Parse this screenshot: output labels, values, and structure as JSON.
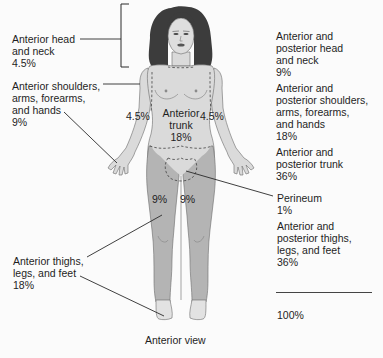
{
  "colors": {
    "background": "#fbfbfb",
    "skin": "#dadada",
    "legs": "#b4b4b4",
    "hair": "#3c3c3c",
    "outline": "#6a6a6a",
    "leader_line": "#2a2a2a",
    "text": "#1e1e1e"
  },
  "caption": "Anterior view",
  "left_labels": [
    {
      "id": "anterior-head-neck",
      "lines": [
        "Anterior head",
        "and neck",
        "4.5%"
      ]
    },
    {
      "id": "anterior-arms",
      "lines": [
        "Anterior shoulders,",
        "arms, forearms,",
        "and hands",
        "9%"
      ]
    },
    {
      "id": "anterior-legs",
      "lines": [
        "Anterior thighs,",
        "legs, and feet",
        "18%"
      ]
    }
  ],
  "body_labels": {
    "left_arm_pct": "4.5%",
    "right_arm_pct": "4.5%",
    "trunk_line1": "Anterior",
    "trunk_line2": "trunk",
    "trunk_pct": "18%",
    "left_thigh_pct": "9%",
    "right_thigh_pct": "9%"
  },
  "right_labels": [
    {
      "id": "ap-head-neck",
      "lines": [
        "Anterior and",
        "posterior head",
        "and neck",
        "9%"
      ]
    },
    {
      "id": "ap-arms",
      "lines": [
        "Anterior and",
        "posterior shoulders,",
        "arms, forearms,",
        "and hands",
        "18%"
      ]
    },
    {
      "id": "ap-trunk",
      "lines": [
        "Anterior and",
        "posterior trunk",
        "36%"
      ]
    },
    {
      "id": "perineum",
      "lines": [
        "Perineum",
        "1%"
      ]
    },
    {
      "id": "ap-legs",
      "lines": [
        "Anterior and",
        "posterior thighs,",
        "legs, and feet",
        "36%"
      ]
    }
  ],
  "total": "100%"
}
